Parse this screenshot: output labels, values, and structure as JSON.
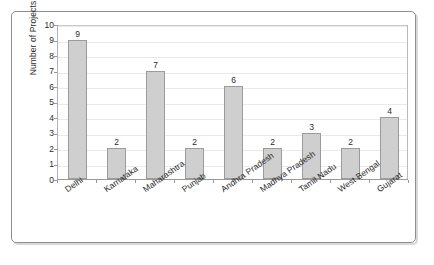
{
  "chart_data": {
    "type": "bar",
    "title": "",
    "subtitle": "",
    "xlabel": "",
    "ylabel": "Number of Projects",
    "ylim": [
      0,
      10
    ],
    "y_ticks": [
      0,
      1,
      2,
      3,
      4,
      5,
      6,
      7,
      8,
      9,
      10
    ],
    "grid": true,
    "legend": "none",
    "categories": [
      "Delhi",
      "Karnataka",
      "Maharashtra",
      "Punjab",
      "Andhra Pradesh",
      "Madhya Pradesh",
      "Tamil Nadu",
      "West Bengal",
      "Gujarat"
    ],
    "values": [
      9,
      2,
      7,
      2,
      6,
      2,
      3,
      2,
      4
    ],
    "data_labels": [
      "9",
      "2",
      "7",
      "2",
      "6",
      "2",
      "3",
      "2",
      "4"
    ],
    "colors": {
      "bar_fill": "#cfcfcf",
      "bar_border": "#9b9b9b",
      "gridline": "#e9e9e9",
      "axis": "#9a9a9a",
      "text": "#2b2b2b",
      "frame": "#8e8e8e",
      "background": "#ffffff"
    }
  }
}
